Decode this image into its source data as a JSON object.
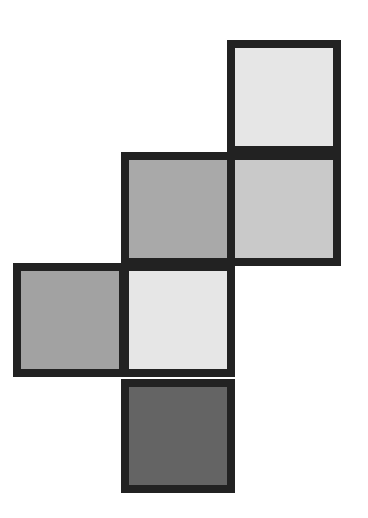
{
  "diagram": {
    "type": "cube-net",
    "border_color": "#222222",
    "border_width": 8,
    "cell_size": 114,
    "cells": [
      {
        "id": "top",
        "x": 227,
        "y": 40,
        "fill": "#e6e6e6"
      },
      {
        "id": "middle-left",
        "x": 121,
        "y": 152,
        "fill": "#a9a9a9"
      },
      {
        "id": "middle-right",
        "x": 227,
        "y": 152,
        "fill": "#c9c9c9"
      },
      {
        "id": "lower-left",
        "x": 13,
        "y": 263,
        "fill": "#a2a2a2"
      },
      {
        "id": "lower-center",
        "x": 121,
        "y": 263,
        "fill": "#e6e6e6"
      },
      {
        "id": "bottom",
        "x": 121,
        "y": 379,
        "fill": "#646464"
      }
    ]
  }
}
